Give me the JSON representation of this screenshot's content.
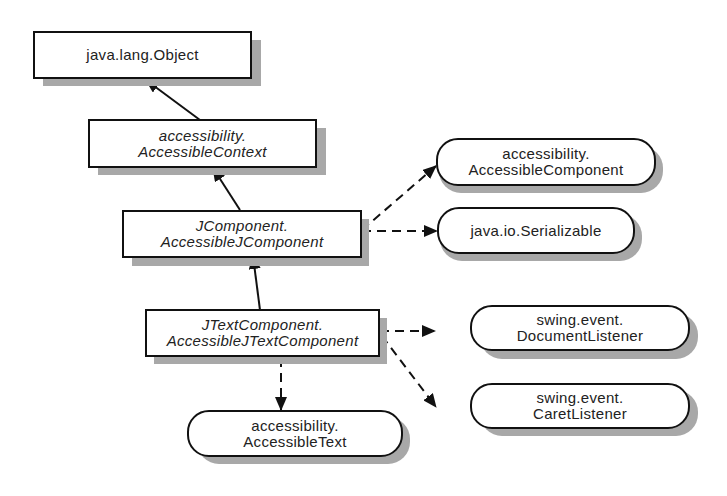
{
  "diagram": {
    "type": "class-hierarchy",
    "classes": [
      {
        "id": "object",
        "lines": [
          "java.lang.Object"
        ],
        "italic": false
      },
      {
        "id": "accessible-context",
        "lines": [
          "accessibility.",
          "AccessibleContext"
        ],
        "italic": true
      },
      {
        "id": "accessible-jcomponent",
        "lines": [
          "JComponent.",
          "AccessibleJComponent"
        ],
        "italic": true
      },
      {
        "id": "accessible-jtextcomponent",
        "lines": [
          "JTextComponent.",
          "AccessibleJTextComponent"
        ],
        "italic": true
      }
    ],
    "interfaces": [
      {
        "id": "accessible-component",
        "lines": [
          "accessibility.",
          "AccessibleComponent"
        ]
      },
      {
        "id": "serializable",
        "lines": [
          "java.io.Serializable"
        ]
      },
      {
        "id": "document-listener",
        "lines": [
          "swing.event.",
          "DocumentListener"
        ]
      },
      {
        "id": "caret-listener",
        "lines": [
          "swing.event.",
          "CaretListener"
        ]
      },
      {
        "id": "accessible-text",
        "lines": [
          "accessibility.",
          "AccessibleText"
        ]
      }
    ],
    "edges": [
      {
        "from": "accessible-context",
        "to": "object",
        "kind": "extends"
      },
      {
        "from": "accessible-jcomponent",
        "to": "accessible-context",
        "kind": "extends"
      },
      {
        "from": "accessible-jtextcomponent",
        "to": "accessible-jcomponent",
        "kind": "extends"
      },
      {
        "from": "accessible-jcomponent",
        "to": "accessible-component",
        "kind": "implements"
      },
      {
        "from": "accessible-jcomponent",
        "to": "serializable",
        "kind": "implements"
      },
      {
        "from": "accessible-jtextcomponent",
        "to": "document-listener",
        "kind": "implements"
      },
      {
        "from": "accessible-jtextcomponent",
        "to": "caret-listener",
        "kind": "implements"
      },
      {
        "from": "accessible-jtextcomponent",
        "to": "accessible-text",
        "kind": "implements"
      }
    ]
  }
}
